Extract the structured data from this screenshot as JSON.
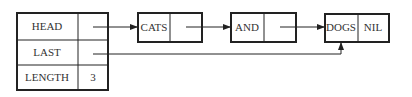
{
  "diagram": {
    "type": "linked-list",
    "header": {
      "rows": [
        {
          "label": "HEAD",
          "value": ""
        },
        {
          "label": "LAST",
          "value": ""
        },
        {
          "label": "LENGTH",
          "value": "3"
        }
      ]
    },
    "nodes": [
      {
        "data": "CATS",
        "next": ""
      },
      {
        "data": "AND",
        "next": ""
      },
      {
        "data": "DOGS",
        "next": "NIL"
      }
    ],
    "edges": [
      {
        "from": "HEAD",
        "to": "CATS"
      },
      {
        "from": "CATS",
        "to": "AND"
      },
      {
        "from": "AND",
        "to": "DOGS"
      },
      {
        "from": "LAST",
        "to": "DOGS"
      }
    ],
    "colors": {
      "stroke": "#222222",
      "text": "#333333",
      "background": "#ffffff"
    }
  }
}
